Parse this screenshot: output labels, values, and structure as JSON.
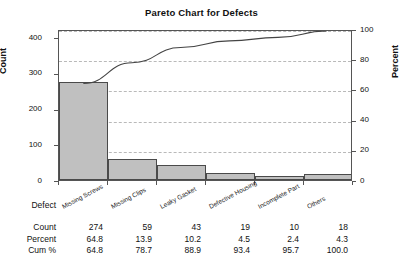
{
  "chart_data": {
    "type": "bar",
    "title": "Pareto Chart for Defects",
    "xlabel": "Defect",
    "ylabel": "Count",
    "y2label": "Percent",
    "categories": [
      "Missing Screws",
      "Missing Clips",
      "Leaky Gasket",
      "Defective Housing",
      "Incomplete Part",
      "Others"
    ],
    "values": [
      274,
      59,
      43,
      19,
      10,
      18
    ],
    "percent": [
      64.8,
      13.9,
      10.2,
      4.5,
      2.4,
      4.3
    ],
    "cum_percent": [
      64.8,
      78.7,
      88.9,
      93.4,
      95.7,
      100.0
    ],
    "ylim": [
      0,
      423
    ],
    "y2lim": [
      0,
      100
    ],
    "yticks": [
      "0",
      "100",
      "200",
      "300",
      "400"
    ],
    "ytick_values": [
      0,
      100,
      200,
      300,
      400
    ],
    "y2ticks": [
      "0",
      "20",
      "40",
      "60",
      "80",
      "100"
    ],
    "y2tick_values": [
      0,
      20,
      40,
      60,
      80,
      100
    ],
    "grid": true,
    "grid_axis": "percent",
    "legend": "none",
    "series": [
      {
        "name": "Count",
        "type": "bar",
        "values": [
          274,
          59,
          43,
          19,
          10,
          18
        ]
      },
      {
        "name": "Cum %",
        "type": "line",
        "values": [
          64.8,
          78.7,
          88.9,
          93.4,
          95.7,
          100.0
        ]
      }
    ],
    "colors": {
      "bar_fill": "#c0c0c0",
      "bar_edge": "#4a4a4a",
      "line": "#444444",
      "grid": "#b9b9b9",
      "frame": "#555555",
      "text": "#111111"
    }
  },
  "table": {
    "axis_label": "Defect",
    "row_labels": [
      "Count",
      "Percent",
      "Cum %"
    ],
    "rows": [
      [
        "274",
        "59",
        "43",
        "19",
        "10",
        "18"
      ],
      [
        "64.8",
        "13.9",
        "10.2",
        "4.5",
        "2.4",
        "4.3"
      ],
      [
        "64.8",
        "78.7",
        "88.9",
        "93.4",
        "95.7",
        "100.0"
      ]
    ]
  }
}
